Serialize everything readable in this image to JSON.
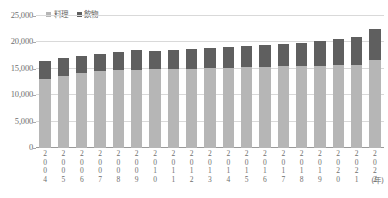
{
  "chart_data": {
    "type": "bar",
    "stacked": true,
    "title": "",
    "xlabel": "(年)",
    "ylabel": "",
    "ylim": [
      0,
      25000
    ],
    "ytick_values": [
      0,
      5000,
      10000,
      15000,
      20000,
      25000
    ],
    "ytick_labels": [
      "0",
      "5,000",
      "10,000",
      "15,000",
      "20,000",
      "25,000"
    ],
    "grid": true,
    "legend_position": "top-left",
    "categories": [
      "2004",
      "2005",
      "2006",
      "2007",
      "2008",
      "2009",
      "2010",
      "2011",
      "2012",
      "2013",
      "2014",
      "2015",
      "2016",
      "2017",
      "2018",
      "2019",
      "2020",
      "2021",
      "2022"
    ],
    "series": [
      {
        "name": "料理",
        "color": "#b6b6b6",
        "values": [
          13100,
          13700,
          14300,
          14500,
          14700,
          14800,
          14900,
          15000,
          15000,
          15100,
          15200,
          15300,
          15400,
          15500,
          15500,
          15600,
          15700,
          15800,
          16600
        ]
      },
      {
        "name": "飲物",
        "color": "#5f5f5f",
        "values": [
          3300,
          3300,
          3200,
          3300,
          3400,
          3800,
          3500,
          3600,
          3700,
          3800,
          3900,
          4000,
          4100,
          4200,
          4400,
          4600,
          4900,
          5200,
          6000
        ]
      }
    ],
    "totals": [
      16400,
      17000,
      17500,
      17800,
      18100,
      18600,
      18400,
      18600,
      18700,
      18900,
      19100,
      19300,
      19500,
      19700,
      19900,
      20200,
      20600,
      21000,
      22600
    ]
  },
  "legend": {
    "items": [
      {
        "label": "料理",
        "color": "#b6b6b6"
      },
      {
        "label": "飲物",
        "color": "#5f5f5f"
      }
    ]
  },
  "axis": {
    "unit_label": "(年)"
  }
}
